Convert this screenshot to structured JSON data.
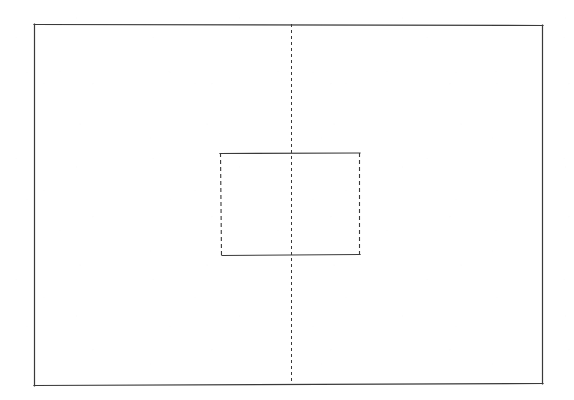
{
  "figure": {
    "canvas": {
      "width": 574,
      "height": 400,
      "background": "#ffffff"
    },
    "stroke": {
      "color": "#3a3a3a",
      "solid_width": 1.2,
      "hidden_width": 1.1,
      "center_width": 1.0,
      "hidden_dash": "4 3",
      "center_dash": "3 3"
    }
  },
  "chart_data": {
    "type": "diagram",
    "xlabel": "",
    "ylabel": "",
    "grid": false,
    "legend": null,
    "xlim": [
      0,
      574
    ],
    "ylim": [
      0,
      400
    ],
    "shapes": [
      {
        "name": "outer-rectangle",
        "kind": "rectangle",
        "linestyle": "solid",
        "x": 34,
        "y": 24,
        "width": 509,
        "height": 361,
        "x2": 543,
        "y2": 385
      },
      {
        "name": "inner-rectangle",
        "kind": "rectangle",
        "linestyle": "mixed",
        "x": 220,
        "y": 153,
        "width": 140,
        "height": 102,
        "x2": 360,
        "y2": 255,
        "edges": {
          "top": "solid",
          "bottom": "solid",
          "left": "dashed",
          "right": "dashed"
        }
      },
      {
        "name": "vertical-centerline",
        "kind": "line",
        "linestyle": "dashed",
        "x1": 291,
        "y1": 24,
        "x2": 291,
        "y2": 385
      }
    ]
  }
}
